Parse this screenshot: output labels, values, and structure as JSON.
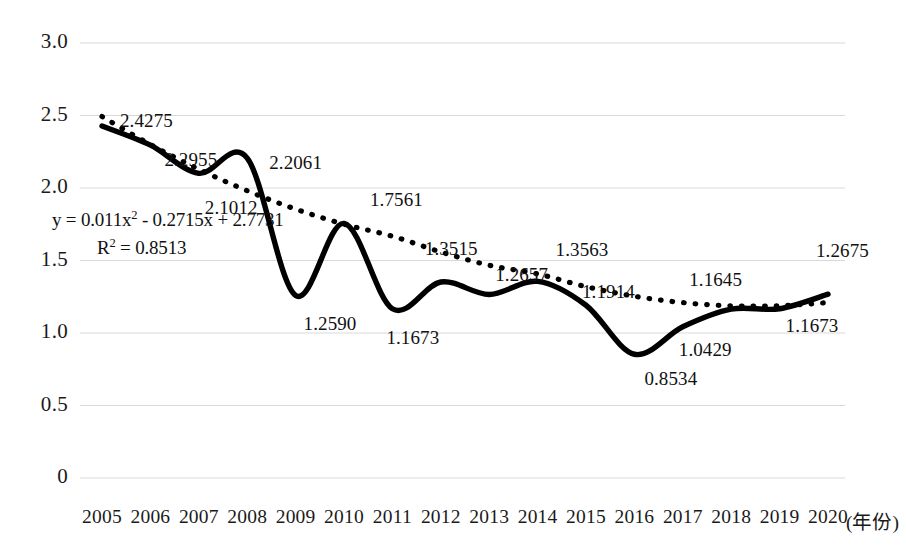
{
  "chart_data": {
    "type": "line",
    "title": "",
    "xlabel": "(年份)",
    "ylabel": "",
    "categories": [
      "2005",
      "2006",
      "2007",
      "2008",
      "2009",
      "2010",
      "2011",
      "2012",
      "2013",
      "2014",
      "2015",
      "2016",
      "2017",
      "2018",
      "2019",
      "2020"
    ],
    "series": [
      {
        "name": "实际值",
        "style": "solid",
        "values": [
          2.4275,
          2.2955,
          2.1012,
          2.2061,
          1.259,
          1.7561,
          1.1673,
          1.3515,
          1.2657,
          1.3563,
          1.1914,
          0.8534,
          1.0429,
          1.1645,
          1.1673,
          1.2675
        ]
      },
      {
        "name": "多项式趋势线",
        "style": "dotted",
        "values": [
          2.4925,
          2.3,
          2.1295,
          1.981,
          1.8545,
          1.75,
          1.6675,
          1.559,
          1.467,
          1.4075,
          1.3195,
          1.2535,
          1.2095,
          1.1875,
          1.1875,
          1.2095
        ]
      }
    ],
    "point_labels": [
      "2.4275",
      "2.2955",
      "2.1012",
      "2.2061",
      "1.2590",
      "1.7561",
      "1.1673",
      "1.3515",
      "1.2657",
      "1.3563",
      "1.1914",
      "0.8534",
      "1.0429",
      "1.1645",
      "1.1673",
      "1.2675"
    ],
    "ytick_labels": [
      "3.0",
      "2.5",
      "2.0",
      "1.5",
      "1.0",
      "0.5",
      "0"
    ],
    "ytick_values": [
      3.0,
      2.5,
      2.0,
      1.5,
      1.0,
      0.5,
      0
    ],
    "ylim": [
      0,
      3.0
    ],
    "grid": true,
    "legend": "none",
    "trendline": {
      "equation_prefix": "y = 0.011x",
      "equation_exponent": "2",
      "equation_suffix": " - 0.2715x + 2.7731",
      "r_squared_prefix": "R",
      "r_squared_exponent": "2",
      "r_squared_suffix": " = 0.8513"
    },
    "colors": {
      "series_line": "#000000",
      "trend_line": "#000000",
      "gridline": "#d9d9d9",
      "text": "#111111",
      "background": "#ffffff"
    }
  }
}
